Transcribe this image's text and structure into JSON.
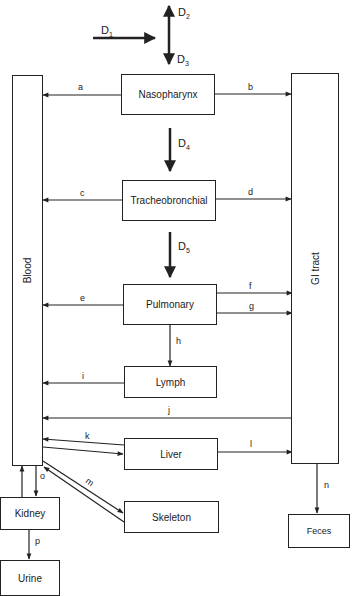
{
  "diagram": {
    "compartments": {
      "blood": "Blood",
      "gi_tract": "GI tract",
      "nasopharynx": "Nasopharynx",
      "tracheobronchial": "Tracheobronchial",
      "pulmonary": "Pulmonary",
      "lymph": "Lymph",
      "liver": "Liver",
      "skeleton": "Skeleton",
      "kidney": "Kidney",
      "urine": "Urine",
      "feces": "Feces"
    },
    "deposition": {
      "d1": {
        "base": "D",
        "sub": "1"
      },
      "d2": {
        "base": "D",
        "sub": "2"
      },
      "d3": {
        "base": "D",
        "sub": "3"
      },
      "d4": {
        "base": "D",
        "sub": "4"
      },
      "d5": {
        "base": "D",
        "sub": "5"
      }
    },
    "pathways": {
      "a": "a",
      "b": "b",
      "c": "c",
      "d": "d",
      "e": "e",
      "f": "f",
      "g": "g",
      "h": "h",
      "i": "i",
      "j": "j",
      "k": "k",
      "l": "l",
      "m": "m",
      "n": "n",
      "o": "o",
      "p": "p"
    },
    "edges": [
      {
        "label": "a",
        "from": "Nasopharynx",
        "to": "Blood"
      },
      {
        "label": "b",
        "from": "Nasopharynx",
        "to": "GI tract"
      },
      {
        "label": "c",
        "from": "Tracheobronchial",
        "to": "Blood"
      },
      {
        "label": "d",
        "from": "Tracheobronchial",
        "to": "GI tract"
      },
      {
        "label": "e",
        "from": "Pulmonary",
        "to": "Blood"
      },
      {
        "label": "f",
        "from": "Pulmonary",
        "to": "GI tract"
      },
      {
        "label": "g",
        "from": "Pulmonary",
        "to": "GI tract"
      },
      {
        "label": "h",
        "from": "Pulmonary",
        "to": "Lymph"
      },
      {
        "label": "i",
        "from": "Lymph",
        "to": "Blood"
      },
      {
        "label": "j",
        "from": "GI tract",
        "to": "Blood"
      },
      {
        "label": "k",
        "from": "Liver",
        "to": "Blood",
        "bidirectional": true
      },
      {
        "label": "l",
        "from": "Liver",
        "to": "GI tract"
      },
      {
        "label": "m",
        "from": "Skeleton",
        "to": "Blood",
        "bidirectional": true
      },
      {
        "label": "n",
        "from": "GI tract",
        "to": "Feces"
      },
      {
        "label": "o",
        "from": "Blood",
        "to": "Kidney",
        "bidirectional": true
      },
      {
        "label": "p",
        "from": "Kidney",
        "to": "Urine"
      }
    ]
  }
}
